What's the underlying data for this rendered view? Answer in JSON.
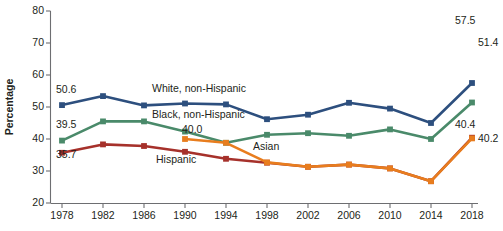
{
  "chart_data": {
    "type": "line",
    "title": "",
    "xlabel": "",
    "ylabel": "Percentage",
    "ylim": [
      20,
      80
    ],
    "yticks": [
      20,
      30,
      40,
      50,
      60,
      70,
      80
    ],
    "grid": false,
    "legend": "inline-labels",
    "x": [
      1978,
      1982,
      1986,
      1990,
      1994,
      1998,
      2002,
      2006,
      2010,
      2014,
      2018
    ],
    "categories": [
      "1978",
      "1982",
      "1986",
      "1990",
      "1994",
      "1998",
      "2002",
      "2006",
      "2010",
      "2014",
      "2018"
    ],
    "series": [
      {
        "name": "White, non-Hispanic",
        "color": "#2d4f7e",
        "label_x": 1990,
        "x": [
          1978,
          1982,
          1986,
          1990,
          1994,
          1998,
          2002,
          2006,
          2010,
          2014,
          2018
        ],
        "values": [
          50.6,
          53.4,
          50.5,
          51.1,
          50.8,
          46.2,
          47.6,
          51.3,
          49.5,
          45.0,
          57.5
        ],
        "start_label": "50.6",
        "end_label": "57.5"
      },
      {
        "name": "Black, non-Hispanic",
        "color": "#4a8a6a",
        "label_x": 1986,
        "x": [
          1978,
          1982,
          1986,
          1990,
          1994,
          1998,
          2002,
          2006,
          2010,
          2014,
          2018
        ],
        "values": [
          39.5,
          45.5,
          45.5,
          42.3,
          38.8,
          41.3,
          41.8,
          41.0,
          43.0,
          40.0,
          51.4
        ],
        "start_label": "39.5",
        "end_label": "51.4"
      },
      {
        "name": "Hispanic",
        "color": "#a6312b",
        "label_x": 1990,
        "x": [
          1978,
          1982,
          1986,
          1990,
          1994,
          1998,
          2002,
          2006,
          2010,
          2014,
          2018
        ],
        "values": [
          35.7,
          38.3,
          37.8,
          36.0,
          33.8,
          32.6,
          31.3,
          32.0,
          30.8,
          26.8,
          40.4
        ],
        "start_label": "35.7",
        "end_label": "40.4"
      },
      {
        "name": "Asian",
        "color": "#e87d1e",
        "label_x": 1998,
        "x": [
          1990,
          1994,
          1998,
          2002,
          2006,
          2010,
          2014,
          2018
        ],
        "values": [
          40.0,
          38.8,
          32.7,
          31.3,
          32.0,
          30.8,
          26.8,
          40.2
        ],
        "start_label": "40.0",
        "end_label": "40.2"
      }
    ],
    "point_labels": [
      {
        "text": "50.6",
        "series": "White, non-Hispanic",
        "anchor": "start"
      },
      {
        "text": "39.5",
        "series": "Black, non-Hispanic",
        "anchor": "start"
      },
      {
        "text": "35.7",
        "series": "Hispanic",
        "anchor": "start"
      },
      {
        "text": "40.0",
        "series": "Asian",
        "anchor": "start"
      },
      {
        "text": "57.5",
        "series": "White, non-Hispanic",
        "anchor": "end"
      },
      {
        "text": "51.4",
        "series": "Black, non-Hispanic",
        "anchor": "end"
      },
      {
        "text": "40.4",
        "series": "Hispanic",
        "anchor": "end"
      },
      {
        "text": "40.2",
        "series": "Asian",
        "anchor": "end"
      }
    ]
  },
  "axis": {
    "y_title": "Percentage",
    "y_ticks": [
      "80",
      "70",
      "60",
      "50",
      "40",
      "30",
      "20"
    ],
    "x_ticks": [
      "1978",
      "1982",
      "1986",
      "1990",
      "1994",
      "1998",
      "2002",
      "2006",
      "2010",
      "2014",
      "2018"
    ]
  },
  "labels": {
    "white": "White, non-Hispanic",
    "black": "Black, non-Hispanic",
    "hispanic": "Hispanic",
    "asian": "Asian",
    "v_white_start": "50.6",
    "v_black_start": "39.5",
    "v_hispanic_start": "35.7",
    "v_asian_start": "40.0",
    "v_white_end": "57.5",
    "v_black_end": "51.4",
    "v_hispanic_end": "40.4",
    "v_asian_end": "40.2"
  },
  "footer": {
    "cropped_caption": ""
  }
}
